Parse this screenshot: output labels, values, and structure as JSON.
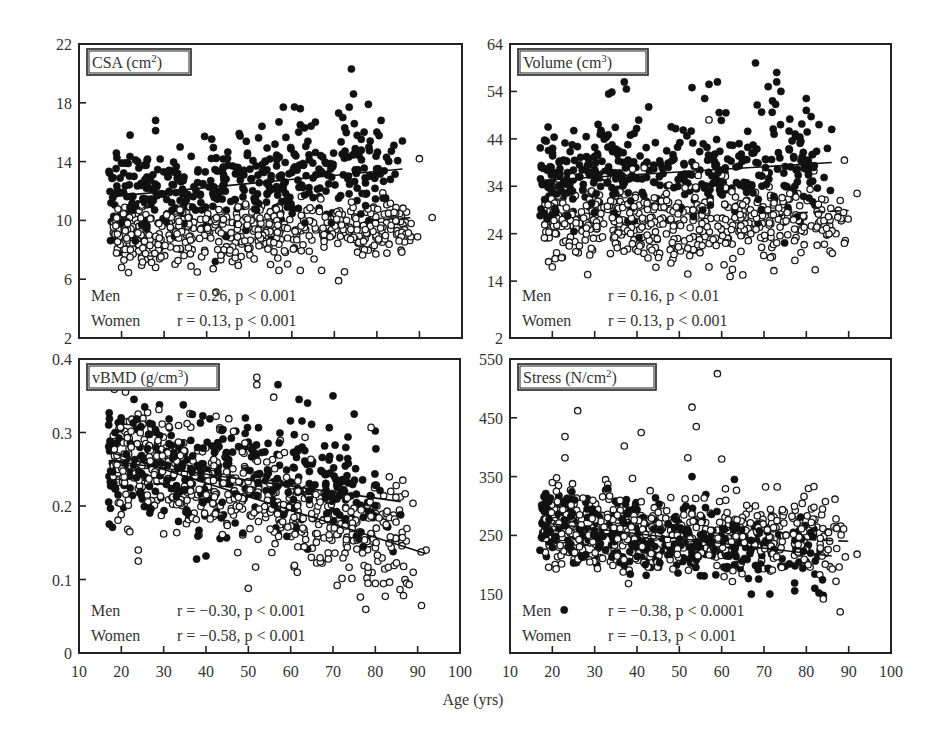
{
  "figure": {
    "x_axis_title": "Age (yrs)"
  },
  "chart_data": [
    {
      "type": "scatter",
      "panel": "top-left",
      "title": "CSA (cm",
      "title_sup": "2",
      "title_tail": ")",
      "xlabel": "Age (yrs)",
      "ylabel": "CSA (cm²)",
      "xlim": [
        10,
        100
      ],
      "ylim": [
        2,
        22
      ],
      "x_ticks": [
        20,
        30,
        40,
        50,
        60,
        70,
        80,
        90
      ],
      "y_ticks": [
        2,
        6,
        10,
        14,
        18,
        22
      ],
      "y_tick_labels": [
        "2",
        "6",
        "10",
        "14",
        "18",
        "22"
      ],
      "show_x_labels": false,
      "grid": false,
      "legend": [
        {
          "group": "Men",
          "marker": "filled circle",
          "stat": "r = 0.26, p < 0.001"
        },
        {
          "group": "Women",
          "marker": "open circle",
          "stat": "r = 0.13, p < 0.001"
        }
      ],
      "series": [
        {
          "name": "Men",
          "marker": "filled",
          "regression": {
            "x": [
              17,
              86
            ],
            "y": [
              11.6,
              13.5
            ],
            "style": "solid"
          },
          "spread": 1.5,
          "n": 420,
          "x_range": [
            17,
            86
          ],
          "outliers": [
            [
              74,
              20.3
            ],
            [
              74.5,
              18.6
            ],
            [
              73.5,
              17.7
            ],
            [
              58,
              17.7
            ],
            [
              62,
              17.6
            ],
            [
              28,
              16.8
            ],
            [
              28,
              16.1
            ],
            [
              22,
              15.8
            ],
            [
              53,
              16.4
            ],
            [
              57,
              16.7
            ],
            [
              62,
              16.5
            ],
            [
              63,
              16.3
            ],
            [
              71,
              17.3
            ],
            [
              72,
              17.0
            ],
            [
              78,
              17.9
            ],
            [
              77,
              16.0
            ],
            [
              81,
              16.8
            ],
            [
              80,
              16.0
            ],
            [
              86,
              15.4
            ],
            [
              84,
              15.1
            ]
          ]
        },
        {
          "name": "Women",
          "marker": "open",
          "regression": {
            "x": [
              78,
              89
            ],
            "y": [
              10.0,
              10.2
            ],
            "style": "dashed"
          },
          "spread": 1.0,
          "n": 520,
          "x_range": [
            18,
            92
          ],
          "outliers": [
            [
              90,
              14.2
            ],
            [
              20,
              6.8
            ],
            [
              28,
              6.8
            ],
            [
              46,
              7.2
            ],
            [
              55,
              7.0
            ],
            [
              57,
              6.6
            ],
            [
              62,
              6.6
            ],
            [
              67,
              6.6
            ],
            [
              71,
              5.9
            ],
            [
              93,
              10.2
            ],
            [
              87,
              8.8
            ],
            [
              85,
              9.1
            ]
          ]
        }
      ]
    },
    {
      "type": "scatter",
      "panel": "top-right",
      "title": "Volume (cm",
      "title_sup": "3",
      "title_tail": ")",
      "xlabel": "Age (yrs)",
      "ylabel": "Volume (cm³)",
      "xlim": [
        10,
        100
      ],
      "ylim": [
        2,
        64
      ],
      "x_ticks": [
        20,
        30,
        40,
        50,
        60,
        70,
        80,
        90
      ],
      "y_ticks": [
        2,
        14,
        24,
        34,
        44,
        54,
        64
      ],
      "y_tick_labels": [
        "2",
        "14",
        "24",
        "34",
        "44",
        "54",
        "64"
      ],
      "show_x_labels": false,
      "grid": false,
      "legend": [
        {
          "group": "Men",
          "marker": "filled circle",
          "stat": "r = 0.16, p < 0.01"
        },
        {
          "group": "Women",
          "marker": "open circle",
          "stat": "r = 0.13, p < 0.001"
        }
      ],
      "series": [
        {
          "name": "Men",
          "marker": "filled",
          "regression": {
            "x": [
              17,
              86
            ],
            "y": [
              35.2,
              39.0
            ],
            "style": "solid"
          },
          "spread": 5.2,
          "n": 420,
          "x_range": [
            17,
            86
          ],
          "outliers": [
            [
              68,
              60.0
            ],
            [
              73,
              58.0
            ],
            [
              73,
              56.0
            ],
            [
              37,
              56.0
            ],
            [
              37.5,
              54.5
            ],
            [
              53,
              54.8
            ],
            [
              57,
              55.5
            ],
            [
              59,
              56.0
            ],
            [
              71,
              55.0
            ],
            [
              74,
              54.0
            ],
            [
              56,
              52.5
            ],
            [
              72,
              52.0
            ],
            [
              80,
              52.5
            ],
            [
              80,
              50.0
            ],
            [
              61,
              49.5
            ],
            [
              19,
              46.5
            ],
            [
              86,
              46.0
            ],
            [
              83,
              47.0
            ]
          ]
        },
        {
          "name": "Women",
          "marker": "open",
          "regression": {
            "x": [
              78,
              90
            ],
            "y": [
              28.4,
              28.9
            ],
            "style": "dashed"
          },
          "spread": 4.0,
          "n": 520,
          "x_range": [
            18,
            92
          ],
          "outliers": [
            [
              20,
              17.0
            ],
            [
              52,
              15.5
            ],
            [
              57,
              17.0
            ],
            [
              62,
              15.0
            ],
            [
              65,
              15.3
            ],
            [
              89,
              39.5
            ],
            [
              92,
              32.5
            ],
            [
              88,
              31.0
            ],
            [
              87,
              24.0
            ],
            [
              89,
              22.0
            ],
            [
              57,
              48.0
            ]
          ]
        }
      ]
    },
    {
      "type": "scatter",
      "panel": "bottom-left",
      "title": "vBMD (g/cm",
      "title_sup": "3",
      "title_tail": ")",
      "xlabel": "Age (yrs)",
      "ylabel": "vBMD (g/cm³)",
      "xlim": [
        10,
        100
      ],
      "ylim": [
        0,
        0.4
      ],
      "x_ticks": [
        20,
        30,
        40,
        50,
        60,
        70,
        80,
        90
      ],
      "x_tick_labels": [
        "10",
        "20",
        "30",
        "40",
        "50",
        "60",
        "70",
        "80",
        "90",
        "100"
      ],
      "y_ticks": [
        0,
        0.1,
        0.2,
        0.3,
        0.4
      ],
      "y_tick_labels": [
        "0",
        "0.1",
        "0.2",
        "0.3",
        "0.4"
      ],
      "show_x_labels": true,
      "grid": false,
      "legend": [
        {
          "group": "Men",
          "marker": "filled circle",
          "stat": "r = −0.30, p < 0.001"
        },
        {
          "group": "Women",
          "marker": "open circle",
          "stat": "r = −0.58, p < 0.001"
        }
      ],
      "series": [
        {
          "name": "Men",
          "marker": "filled",
          "regression": {
            "x": [
              17,
              86
            ],
            "y": [
              0.262,
              0.206
            ],
            "style": "solid"
          },
          "spread": 0.038,
          "n": 420,
          "x_range": [
            17,
            86
          ],
          "outliers": [
            [
              57,
              0.365
            ],
            [
              70,
              0.35
            ],
            [
              62,
              0.345
            ],
            [
              64,
              0.34
            ],
            [
              23,
              0.345
            ],
            [
              75,
              0.325
            ],
            [
              80,
              0.302
            ],
            [
              86,
              0.188
            ],
            [
              40,
              0.132
            ]
          ]
        },
        {
          "name": "Women",
          "marker": "open",
          "regression": {
            "x": [
              18,
              92
            ],
            "y": [
              0.272,
              0.135
            ],
            "style": "solid"
          },
          "spread": 0.035,
          "n": 520,
          "x_range": [
            18,
            92
          ],
          "outliers": [
            [
              52,
              0.375
            ],
            [
              52,
              0.365
            ],
            [
              56,
              0.348
            ],
            [
              50,
              0.088
            ],
            [
              24,
              0.14
            ],
            [
              24,
              0.125
            ],
            [
              30,
              0.162
            ],
            [
              22,
              0.165
            ],
            [
              87,
              0.1
            ],
            [
              88,
              0.093
            ],
            [
              92,
              0.14
            ],
            [
              78,
              0.102
            ],
            [
              71,
              0.092
            ],
            [
              79,
              0.307
            ]
          ]
        }
      ]
    },
    {
      "type": "scatter",
      "panel": "bottom-right",
      "title": "Stress (N/cm",
      "title_sup": "2",
      "title_tail": ")",
      "xlabel": "Age (yrs)",
      "ylabel": "Stress (N/cm²)",
      "xlim": [
        10,
        100
      ],
      "ylim": [
        50,
        550
      ],
      "x_ticks": [
        20,
        30,
        40,
        50,
        60,
        70,
        80,
        90
      ],
      "x_tick_labels": [
        "10",
        "20",
        "30",
        "40",
        "50",
        "60",
        "70",
        "80",
        "90",
        "100"
      ],
      "y_ticks": [
        150,
        250,
        350,
        450,
        550
      ],
      "y_tick_labels": [
        "150",
        "250",
        "350",
        "450",
        "550"
      ],
      "show_x_labels": true,
      "grid": false,
      "legend": [
        {
          "group": "Men",
          "marker": "filled circle",
          "stat": "r = −0.38, p < 0.0001"
        },
        {
          "group": "Women",
          "marker": "open circle",
          "stat": "r = −0.13, p < 0.001"
        }
      ],
      "series": [
        {
          "name": "Men",
          "marker": "filled",
          "regression": {
            "x": [
              17,
              86
            ],
            "y": [
              272,
              215
            ],
            "style": "solid"
          },
          "spread": 30,
          "n": 420,
          "x_range": [
            17,
            86
          ],
          "outliers": [
            [
              82,
              160
            ],
            [
              83,
              152
            ],
            [
              84,
              148
            ],
            [
              67,
              150
            ],
            [
              63,
              345
            ],
            [
              53,
              350
            ]
          ]
        },
        {
          "name": "Women",
          "marker": "open",
          "regression": {
            "x": [
              80,
              90
            ],
            "y": [
              243,
              240
            ],
            "style": "dashed"
          },
          "spread": 32,
          "n": 520,
          "x_range": [
            18,
            92
          ],
          "outliers": [
            [
              59,
              525
            ],
            [
              53,
              468
            ],
            [
              26,
              462
            ],
            [
              54,
              435
            ],
            [
              41,
              425
            ],
            [
              23,
              418
            ],
            [
              37,
              402
            ],
            [
              23,
              382
            ],
            [
              60,
              380
            ],
            [
              52,
              382
            ],
            [
              87,
              278
            ],
            [
              92,
              218
            ],
            [
              87,
              172
            ],
            [
              88,
              120
            ],
            [
              84,
              142
            ],
            [
              38,
              168
            ],
            [
              20,
              340
            ],
            [
              21,
              348
            ]
          ]
        }
      ]
    }
  ]
}
